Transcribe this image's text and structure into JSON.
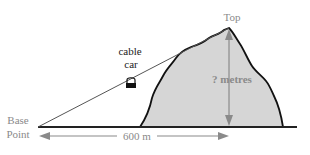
{
  "diagram": {
    "labels": {
      "top": "Top",
      "cable_car_line1": "cable",
      "cable_car_line2": "car",
      "base_line1": "Base",
      "base_line2": "Point",
      "height": "? metres",
      "distance": "600 m"
    },
    "icons": {
      "cable_car": "cable-car-icon"
    },
    "colors": {
      "mountain_fill": "#d6d6d6",
      "outline": "#111111",
      "arrow": "#8a8a8a",
      "cable": "#555555",
      "label_gray": "#8a8a8a",
      "label_dark": "#222222"
    }
  }
}
